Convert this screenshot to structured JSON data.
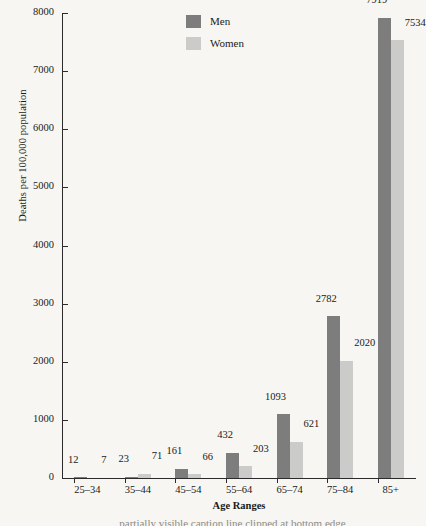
{
  "chart_data": {
    "type": "bar",
    "title": "",
    "xlabel": "Age Ranges",
    "ylabel": "Deaths per 100,000 population",
    "categories": [
      "25–34",
      "35–44",
      "45–54",
      "55–64",
      "65–74",
      "75–84",
      "85+"
    ],
    "series": [
      {
        "name": "Men",
        "color": "#7d7d7d",
        "values": [
          12,
          23,
          161,
          432,
          1093,
          2782,
          7919
        ]
      },
      {
        "name": "Women",
        "color": "#cbcbc9",
        "values": [
          7,
          71,
          66,
          203,
          621,
          2020,
          7534
        ]
      }
    ],
    "ylim": [
      0,
      8000
    ],
    "yticks": [
      0,
      1000,
      2000,
      3000,
      4000,
      5000,
      6000,
      7000,
      8000
    ],
    "ytick_labels": [
      "0",
      "1000",
      "2000",
      "3000",
      "4000",
      "5000",
      "6000",
      "7000",
      "8000"
    ],
    "grid": false,
    "legend_position": "top-center",
    "data_labels": true
  },
  "caption": {
    "clipped_text": "partially visible caption line clipped at bottom edge"
  }
}
